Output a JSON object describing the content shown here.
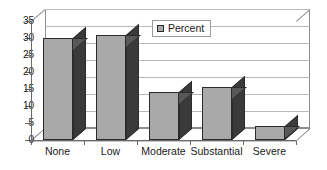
{
  "chart_data": {
    "type": "bar",
    "title": "",
    "subtitle": "",
    "xlabel": "",
    "ylabel": "",
    "categories": [
      "None",
      "Low",
      "Moderate",
      "Substantial",
      "Severe"
    ],
    "series": [
      {
        "name": "Percent",
        "values": [
          30,
          31,
          14,
          15.5,
          4
        ]
      }
    ],
    "ylim": [
      0,
      35
    ],
    "yticks": [
      0,
      5,
      10,
      15,
      20,
      25,
      30,
      35
    ],
    "ytick_labels": [
      "0",
      "5",
      "10",
      "15",
      "20",
      "25",
      "30",
      "35"
    ],
    "grid": "horizontal",
    "legend": {
      "position": "top-center-inside",
      "entries": [
        {
          "label": "Percent",
          "swatch_name": "percent-swatch",
          "color": "#a9a9a9"
        }
      ]
    },
    "style": {
      "three_d": true,
      "bar_front_color": "#a9a9a9",
      "bar_side_color": "#3a3a3a",
      "bar_top_color": "#585858",
      "bar_outline_color": "#2b2b2b",
      "gridline_color": "#b9b9b9",
      "axis_color": "#6a6a6a",
      "wall_color": "#8d8d8d",
      "background": "#ffffff",
      "text_color": "#1a1a1a"
    }
  }
}
